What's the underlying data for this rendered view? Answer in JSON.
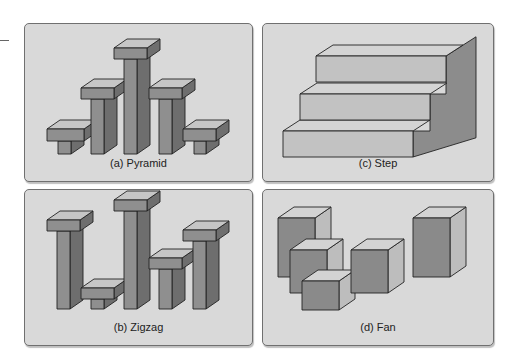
{
  "figure": {
    "panels": [
      {
        "id": "pyramid",
        "caption": "(a) Pyramid",
        "box": {
          "x": 24,
          "y": 23,
          "w": 227,
          "h": 157
        },
        "shape_type": "t-pillars",
        "depth": {
          "dx": 13,
          "dy": -9
        },
        "pillars": [
          {
            "capX": 22,
            "capW": 37,
            "capTop": 105,
            "capH": 12,
            "stemX": 33,
            "stemW": 13,
            "base": 130
          },
          {
            "capX": 56,
            "capW": 33,
            "capTop": 64,
            "capH": 11,
            "stemX": 66,
            "stemW": 13,
            "base": 130
          },
          {
            "capX": 89,
            "capW": 33,
            "capTop": 24,
            "capH": 11,
            "stemX": 99,
            "stemW": 13,
            "base": 130
          },
          {
            "capX": 124,
            "capW": 33,
            "capTop": 64,
            "capH": 11,
            "stemX": 134,
            "stemW": 13,
            "base": 130
          },
          {
            "capX": 158,
            "capW": 33,
            "capTop": 105,
            "capH": 12,
            "stemX": 169,
            "stemW": 12,
            "base": 130
          }
        ]
      },
      {
        "id": "zigzag",
        "caption": "(b) Zigzag",
        "box": {
          "x": 24,
          "y": 189,
          "w": 227,
          "h": 155
        },
        "shape_type": "t-pillars",
        "depth": {
          "dx": 13,
          "dy": -9
        },
        "pillars": [
          {
            "capX": 22,
            "capW": 33,
            "capTop": 30,
            "capH": 11,
            "stemX": 32,
            "stemW": 13,
            "base": 119
          },
          {
            "capX": 56,
            "capW": 33,
            "capTop": 98,
            "capH": 11,
            "stemX": 66,
            "stemW": 13,
            "base": 119
          },
          {
            "capX": 89,
            "capW": 33,
            "capTop": 10,
            "capH": 11,
            "stemX": 99,
            "stemW": 13,
            "base": 119
          },
          {
            "capX": 124,
            "capW": 33,
            "capTop": 68,
            "capH": 11,
            "stemX": 134,
            "stemW": 13,
            "base": 119
          },
          {
            "capX": 158,
            "capW": 33,
            "capTop": 40,
            "capH": 11,
            "stemX": 168,
            "stemW": 13,
            "base": 119
          }
        ]
      },
      {
        "id": "step",
        "caption": "(c) Step",
        "box": {
          "x": 262,
          "y": 23,
          "w": 230,
          "h": 157
        },
        "shape_type": "steps",
        "depth": {
          "dx": 50,
          "dy": -32
        },
        "steps": [
          {
            "x": 20,
            "w": 130,
            "top": 107,
            "h": 26
          },
          {
            "x": 37,
            "w": 130,
            "top": 70,
            "h": 26
          },
          {
            "x": 53,
            "w": 130,
            "top": 32,
            "h": 26
          }
        ]
      },
      {
        "id": "fan",
        "caption": "(d) Fan",
        "box": {
          "x": 262,
          "y": 189,
          "w": 230,
          "h": 155
        },
        "shape_type": "boxes",
        "depth": {
          "dx": 16,
          "dy": -11
        },
        "boxes": [
          {
            "x": 15,
            "y": 28,
            "w": 37,
            "h": 59
          },
          {
            "x": 27,
            "y": 60,
            "w": 37,
            "h": 43
          },
          {
            "x": 39,
            "y": 91,
            "w": 37,
            "h": 29
          },
          {
            "x": 88,
            "y": 60,
            "w": 37,
            "h": 43
          },
          {
            "x": 150,
            "y": 28,
            "w": 37,
            "h": 59
          }
        ]
      }
    ]
  },
  "colors": {
    "panel_bg": "#d9d9d9",
    "panel_border": "#707070",
    "front_face": "#8f8f8f",
    "top_face": "#c6c6c6",
    "side_face": "#6e6e6e",
    "step_front": "#c2c2c2",
    "step_top": "#d4d4d4",
    "step_side": "#8c8c8c",
    "box_front": "#8a8a8a",
    "box_top": "#d3d3d3",
    "box_side": "#bdbdbd",
    "stroke": "#222222"
  }
}
